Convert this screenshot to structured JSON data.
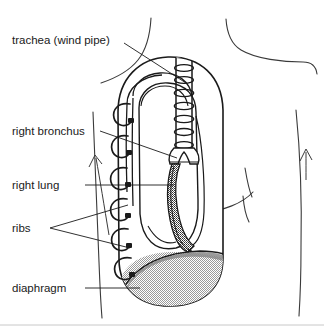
{
  "figure": {
    "background_color": "#ffffff",
    "ink_color": "#1a1a1a",
    "diaphragm_fill_color": "#d9d9d9",
    "diaphragm_band_color": "#8a8a8a",
    "bronchus_fill_color": "#5a5a5a",
    "width": 324,
    "height": 329
  },
  "labels": {
    "trachea": "trachea (wind pipe)",
    "bronchus": "right bronchus",
    "lung": "right lung",
    "ribs": "ribs",
    "diaphragm": "diaphragm"
  },
  "structures": {
    "torso": "body-outline",
    "chest_cavity": "pleural-cavity-outline",
    "trachea": "trachea-with-cartilage-rings",
    "bronchus": "right-bronchus-tube",
    "lung": "right-lung-mass",
    "ribs": "rib-hooks",
    "diaphragm": "diaphragm-dome"
  },
  "counts": {
    "rib_hooks": 6,
    "trachea_rings": 7
  }
}
